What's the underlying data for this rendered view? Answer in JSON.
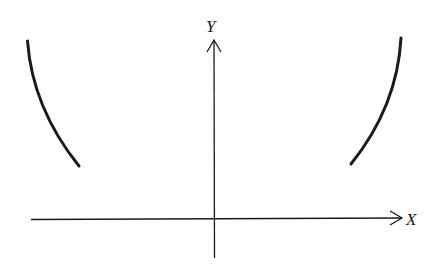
{
  "diagram": {
    "type": "coordinate-sketch",
    "axes": {
      "x_label": "X",
      "y_label": "Y"
    },
    "curves": [
      {
        "name": "left-branch",
        "description": "decreasing concave-up curve in upper-left region"
      },
      {
        "name": "right-branch",
        "description": "increasing concave-up curve in upper-right region"
      }
    ],
    "colors": {
      "stroke": "#1a1a1a",
      "background": "#ffffff"
    }
  }
}
